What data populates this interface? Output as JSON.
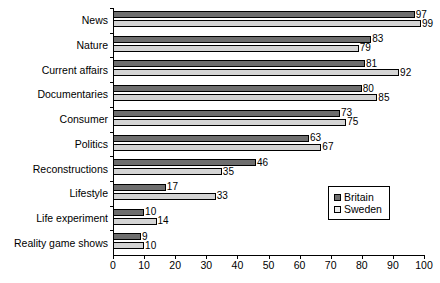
{
  "chart_data": {
    "type": "bar",
    "orientation": "horizontal",
    "title": "",
    "xlabel": "",
    "ylabel": "",
    "xlim": [
      0,
      100
    ],
    "xticks": [
      0,
      10,
      20,
      30,
      40,
      50,
      60,
      70,
      80,
      90,
      100
    ],
    "grid": false,
    "legend_position": "right-inside",
    "categories": [
      "News",
      "Nature",
      "Current affairs",
      "Documentaries",
      "Consumer",
      "Politics",
      "Reconstructions",
      "Lifestyle",
      "Life experiment",
      "Reality game shows"
    ],
    "series": [
      {
        "name": "Britain",
        "color": "#6e6e6e",
        "values": [
          97,
          83,
          81,
          80,
          73,
          63,
          46,
          17,
          10,
          9
        ]
      },
      {
        "name": "Sweden",
        "color": "#d4d4d4",
        "values": [
          99,
          79,
          92,
          85,
          75,
          67,
          35,
          33,
          14,
          10
        ]
      }
    ]
  },
  "legend": {
    "items": [
      {
        "label": "Britain",
        "swatch": "britain"
      },
      {
        "label": "Sweden",
        "swatch": "sweden"
      }
    ]
  }
}
